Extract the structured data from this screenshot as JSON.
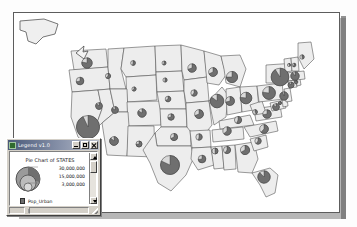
{
  "window": {
    "legend": {
      "title": "Legend v1.0",
      "title_icon": "map-legend-icon",
      "buttons": {
        "minimize": "minimize-button",
        "maximize": "maximize-button",
        "close": "close-button"
      },
      "heading": "Pie Chart of STATES",
      "size_class_values": [
        "30,000,000",
        "15,000,000",
        "3,000,000"
      ],
      "swatches": [
        {
          "label": "Pop_Urban",
          "color": "#6e6e6e"
        },
        {
          "label": "Pop_Rural",
          "color": "#ffffff"
        }
      ]
    }
  },
  "colors": {
    "pie_urban": "#6f6f6f",
    "pie_rural": "#d9d9d9",
    "state_fill": "#ededed",
    "state_stroke": "#4a4a4a",
    "page_background": "#ffffff",
    "window_chrome": "#d4d0c8",
    "titlebar_start": "#4a5a7a",
    "titlebar_end": "#b9bfcb"
  },
  "chart_data": {
    "type": "pie",
    "title": "Pie Chart of STATES",
    "legend": {
      "position": "floating-window-bottom-left",
      "size_classes": [
        30000000,
        15000000,
        3000000
      ],
      "series": [
        "Pop_Urban",
        "Pop_Rural"
      ]
    },
    "categories": [
      "Pop_Urban",
      "Pop_Rural"
    ],
    "states": [
      {
        "state": "WA",
        "x": 73,
        "y": 50,
        "r": 5.2,
        "urban": 0.78
      },
      {
        "state": "OR",
        "x": 66,
        "y": 68,
        "r": 3.8,
        "urban": 0.72
      },
      {
        "state": "CA",
        "x": 74,
        "y": 114,
        "r": 11.5,
        "urban": 0.93
      },
      {
        "state": "ID",
        "x": 94,
        "y": 63,
        "r": 2.6,
        "urban": 0.62
      },
      {
        "state": "NV",
        "x": 85,
        "y": 93,
        "r": 3.4,
        "urban": 0.88
      },
      {
        "state": "MT",
        "x": 119,
        "y": 50,
        "r": 2.4,
        "urban": 0.53
      },
      {
        "state": "WY",
        "x": 120,
        "y": 76,
        "r": 2.1,
        "urban": 0.62
      },
      {
        "state": "UT",
        "x": 101,
        "y": 97,
        "r": 3.4,
        "urban": 0.86
      },
      {
        "state": "AZ",
        "x": 100,
        "y": 128,
        "r": 4.4,
        "urban": 0.87
      },
      {
        "state": "CO",
        "x": 128,
        "y": 100,
        "r": 4.2,
        "urban": 0.84
      },
      {
        "state": "NM",
        "x": 125,
        "y": 131,
        "r": 3.0,
        "urban": 0.74
      },
      {
        "state": "ND",
        "x": 150,
        "y": 50,
        "r": 2.0,
        "urban": 0.55
      },
      {
        "state": "SD",
        "x": 151,
        "y": 67,
        "r": 2.1,
        "urban": 0.51
      },
      {
        "state": "NE",
        "x": 154,
        "y": 86,
        "r": 2.8,
        "urban": 0.66
      },
      {
        "state": "KS",
        "x": 157,
        "y": 104,
        "r": 3.2,
        "urban": 0.71
      },
      {
        "state": "OK",
        "x": 160,
        "y": 124,
        "r": 3.6,
        "urban": 0.68
      },
      {
        "state": "TX",
        "x": 156,
        "y": 152,
        "r": 9.5,
        "urban": 0.82
      },
      {
        "state": "MN",
        "x": 178,
        "y": 55,
        "r": 4.2,
        "urban": 0.7
      },
      {
        "state": "IA",
        "x": 180,
        "y": 80,
        "r": 3.2,
        "urban": 0.61
      },
      {
        "state": "MO",
        "x": 185,
        "y": 101,
        "r": 4.4,
        "urban": 0.69
      },
      {
        "state": "AR",
        "x": 185,
        "y": 124,
        "r": 3.2,
        "urban": 0.53
      },
      {
        "state": "LA",
        "x": 188,
        "y": 146,
        "r": 3.8,
        "urban": 0.73
      },
      {
        "state": "WI",
        "x": 199,
        "y": 59,
        "r": 4.4,
        "urban": 0.68
      },
      {
        "state": "IL",
        "x": 203,
        "y": 88,
        "r": 6.8,
        "urban": 0.85
      },
      {
        "state": "MS",
        "x": 201,
        "y": 138,
        "r": 3.0,
        "urban": 0.49
      },
      {
        "state": "MI",
        "x": 218,
        "y": 64,
        "r": 5.6,
        "urban": 0.75
      },
      {
        "state": "IN",
        "x": 216,
        "y": 88,
        "r": 4.4,
        "urban": 0.71
      },
      {
        "state": "TN",
        "x": 213,
        "y": 118,
        "r": 4.2,
        "urban": 0.64
      },
      {
        "state": "AL",
        "x": 213,
        "y": 137,
        "r": 3.6,
        "urban": 0.59
      },
      {
        "state": "KY",
        "x": 224,
        "y": 107,
        "r": 3.6,
        "urban": 0.56
      },
      {
        "state": "OH",
        "x": 232,
        "y": 85,
        "r": 5.8,
        "urban": 0.77
      },
      {
        "state": "GA",
        "x": 231,
        "y": 137,
        "r": 4.6,
        "urban": 0.67
      },
      {
        "state": "WV",
        "x": 241,
        "y": 99,
        "r": 2.4,
        "urban": 0.42
      },
      {
        "state": "FL",
        "x": 250,
        "y": 164,
        "r": 6.2,
        "urban": 0.88
      },
      {
        "state": "SC",
        "x": 244,
        "y": 128,
        "r": 3.2,
        "urban": 0.6
      },
      {
        "state": "NC",
        "x": 250,
        "y": 116,
        "r": 4.4,
        "urban": 0.62
      },
      {
        "state": "VA",
        "x": 253,
        "y": 101,
        "r": 4.2,
        "urban": 0.72
      },
      {
        "state": "PA",
        "x": 255,
        "y": 80,
        "r": 6.4,
        "urban": 0.77
      },
      {
        "state": "NY",
        "x": 266,
        "y": 64,
        "r": 8.8,
        "urban": 0.91
      },
      {
        "state": "MD",
        "x": 262,
        "y": 94,
        "r": 3.4,
        "urban": 0.86
      },
      {
        "state": "DE",
        "x": 266,
        "y": 90,
        "r": 1.6,
        "urban": 0.82
      },
      {
        "state": "NJ",
        "x": 270,
        "y": 83,
        "r": 4.2,
        "urban": 0.94
      },
      {
        "state": "CT",
        "x": 277,
        "y": 72,
        "r": 3.0,
        "urban": 0.88
      },
      {
        "state": "RI",
        "x": 282,
        "y": 69,
        "r": 1.8,
        "urban": 0.91
      },
      {
        "state": "MA",
        "x": 281,
        "y": 63,
        "r": 4.2,
        "urban": 0.91
      },
      {
        "state": "VT",
        "x": 275,
        "y": 52,
        "r": 1.6,
        "urban": 0.38
      },
      {
        "state": "NH",
        "x": 280,
        "y": 52,
        "r": 1.8,
        "urban": 0.59
      },
      {
        "state": "ME",
        "x": 288,
        "y": 44,
        "r": 2.2,
        "urban": 0.45
      }
    ]
  }
}
